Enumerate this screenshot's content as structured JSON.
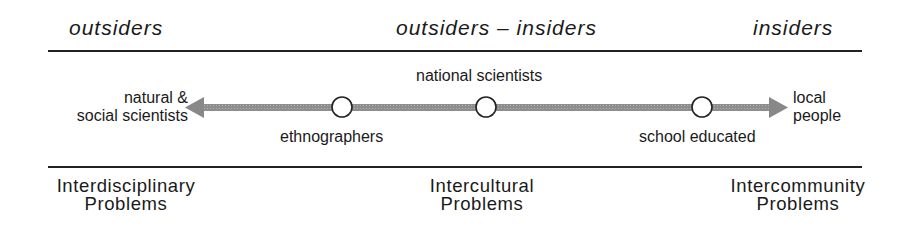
{
  "header": {
    "left": "outsiders",
    "center": "outsiders – insiders",
    "right": "insiders"
  },
  "continuum": {
    "left_end": {
      "line1": "natural &",
      "line2": "social scientists"
    },
    "right_end": {
      "line1": "local",
      "line2": "people"
    },
    "nodes": [
      {
        "label": "ethnographers",
        "position": "below"
      },
      {
        "label": "national scientists",
        "position": "above"
      },
      {
        "label": "school educated",
        "position": "below"
      }
    ],
    "arrow_color": "#8a8a8a",
    "node_fill": "#ffffff",
    "node_stroke": "#222222"
  },
  "footer": {
    "left": {
      "line1": "Interdisciplinary",
      "line2": "Problems"
    },
    "center": {
      "line1": "Intercultural",
      "line2": "Problems"
    },
    "right": {
      "line1": "Intercommunity",
      "line2": "Problems"
    }
  }
}
